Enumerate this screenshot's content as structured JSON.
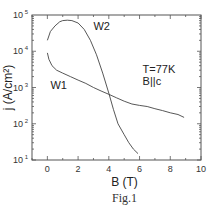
{
  "chart_data": {
    "type": "line",
    "title": "",
    "caption": "Fig.1",
    "xlabel": "B (T)",
    "ylabel": "j (A/cm²)",
    "xlim": [
      -1,
      10
    ],
    "ylim": [
      10,
      100000
    ],
    "yscale": "log",
    "x_ticks": [
      0,
      2,
      4,
      6,
      8,
      10
    ],
    "x_tick_labels": [
      "0",
      "2",
      "4",
      "6",
      "8",
      "10"
    ],
    "y_ticks": [
      10,
      100,
      1000,
      10000,
      100000
    ],
    "y_tick_labels": [
      {
        "base": "10",
        "exp": "1"
      },
      {
        "base": "10",
        "exp": "2"
      },
      {
        "base": "10",
        "exp": "3"
      },
      {
        "base": "10",
        "exp": "4"
      },
      {
        "base": "10",
        "exp": "5"
      }
    ],
    "grid": false,
    "annotations": [
      {
        "text": "T=77K",
        "x": 6.2,
        "y": 2500
      },
      {
        "text": "B||c",
        "x": 6.2,
        "y": 1200
      }
    ],
    "series": [
      {
        "name": "W1",
        "label_pos": {
          "x": 0.2,
          "y": 900
        },
        "x": [
          0.0,
          0.1,
          0.3,
          0.6,
          1.0,
          1.5,
          2.0,
          2.5,
          3.0,
          3.5,
          4.0,
          4.5,
          5.0,
          5.5,
          6.0,
          6.5,
          7.0,
          7.5,
          8.0,
          8.5,
          8.9
        ],
        "y": [
          9000,
          6000,
          4000,
          3000,
          2500,
          2000,
          1600,
          1300,
          1000,
          800,
          650,
          520,
          420,
          350,
          320,
          300,
          260,
          230,
          200,
          180,
          150
        ]
      },
      {
        "name": "W2",
        "label_pos": {
          "x": 3.0,
          "y": 38000
        },
        "x": [
          0.0,
          0.2,
          0.5,
          0.8,
          1.0,
          1.3,
          1.6,
          2.0,
          2.4,
          2.8,
          3.2,
          3.6,
          4.0,
          4.3,
          4.6,
          5.0,
          5.3,
          5.6,
          5.9
        ],
        "y": [
          20000,
          35000,
          50000,
          65000,
          70000,
          72000,
          70000,
          60000,
          40000,
          20000,
          8000,
          2500,
          700,
          250,
          100,
          50,
          30,
          20,
          15
        ]
      }
    ]
  }
}
